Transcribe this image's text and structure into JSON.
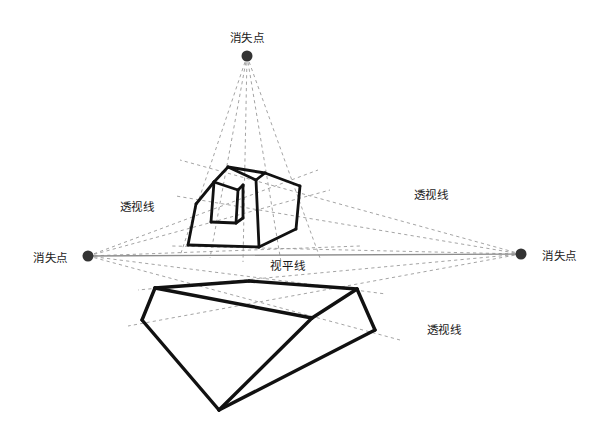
{
  "diagram": {
    "background_color": "#ffffff",
    "ink_color": "#111111",
    "guide_color": "#9a9a9a",
    "horizon_color": "#8c8c8c",
    "labels": {
      "vanishing_point_top": "消失点",
      "vanishing_point_left": "消失点",
      "vanishing_point_right": "消失点",
      "horizon_line": "视平线",
      "perspective_line_left": "透视线",
      "perspective_line_right": "透视线",
      "perspective_line_lower_right": "透视线"
    },
    "vanishing_points": [
      {
        "name": "top",
        "x": 247,
        "y": 56,
        "radius": 5.5,
        "color": "#333333"
      },
      {
        "name": "left",
        "x": 88,
        "y": 256,
        "radius": 5.5,
        "color": "#333333"
      },
      {
        "name": "right",
        "x": 521,
        "y": 254,
        "radius": 5.5,
        "color": "#333333"
      }
    ],
    "horizon": {
      "x1": 88,
      "y1": 256,
      "x2": 521,
      "y2": 254
    },
    "label_positions": {
      "vanishing_point_top": {
        "x": 247,
        "y": 42,
        "anchor": "middle"
      },
      "vanishing_point_left": {
        "x": 68,
        "y": 262,
        "anchor": "end"
      },
      "vanishing_point_right": {
        "x": 542,
        "y": 260,
        "anchor": "start"
      },
      "horizon_line": {
        "x": 288,
        "y": 270,
        "anchor": "middle"
      },
      "perspective_line_left": {
        "x": 137,
        "y": 211,
        "anchor": "middle"
      },
      "perspective_line_right": {
        "x": 431,
        "y": 199,
        "anchor": "middle"
      },
      "perspective_line_lower_right": {
        "x": 444,
        "y": 334,
        "anchor": "middle"
      }
    },
    "upper_box": {
      "name": "upper-cube",
      "outline": [
        [
          188,
          245
        ],
        [
          196,
          204
        ],
        [
          214,
          182
        ],
        [
          228,
          167
        ],
        [
          265,
          173
        ],
        [
          300,
          186
        ],
        [
          296,
          229
        ],
        [
          259,
          247
        ]
      ],
      "edges": [
        {
          "from": [
            188,
            245
          ],
          "to": [
            259,
            247
          ]
        },
        {
          "from": [
            259,
            247
          ],
          "to": [
            296,
            229
          ]
        },
        {
          "from": [
            296,
            229
          ],
          "to": [
            300,
            186
          ]
        },
        {
          "from": [
            300,
            186
          ],
          "to": [
            265,
            173
          ]
        },
        {
          "from": [
            265,
            173
          ],
          "to": [
            228,
            167
          ]
        },
        {
          "from": [
            228,
            167
          ],
          "to": [
            214,
            182
          ]
        },
        {
          "from": [
            214,
            182
          ],
          "to": [
            196,
            204
          ]
        },
        {
          "from": [
            196,
            204
          ],
          "to": [
            188,
            245
          ]
        },
        {
          "from": [
            259,
            247
          ],
          "to": [
            256,
            180
          ]
        },
        {
          "from": [
            256,
            180
          ],
          "to": [
            228,
            167
          ]
        },
        {
          "from": [
            256,
            180
          ],
          "to": [
            265,
            173
          ]
        },
        {
          "from": [
            214,
            182
          ],
          "to": [
            238,
            190
          ]
        },
        {
          "from": [
            238,
            190
          ],
          "to": [
            236,
            223
          ]
        },
        {
          "from": [
            236,
            223
          ],
          "to": [
            211,
            222
          ]
        },
        {
          "from": [
            211,
            222
          ],
          "to": [
            214,
            182
          ]
        },
        {
          "from": [
            238,
            190
          ],
          "to": [
            243,
            185
          ]
        },
        {
          "from": [
            243,
            185
          ],
          "to": [
            243,
            218
          ]
        },
        {
          "from": [
            243,
            218
          ],
          "to": [
            236,
            223
          ]
        }
      ]
    },
    "lower_box": {
      "name": "lower-cube",
      "edges": [
        {
          "from": [
            155,
            288
          ],
          "to": [
            249,
            281
          ]
        },
        {
          "from": [
            249,
            281
          ],
          "to": [
            357,
            289
          ]
        },
        {
          "from": [
            357,
            289
          ],
          "to": [
            312,
            318
          ]
        },
        {
          "from": [
            312,
            318
          ],
          "to": [
            155,
            288
          ]
        },
        {
          "from": [
            155,
            288
          ],
          "to": [
            142,
            320
          ]
        },
        {
          "from": [
            142,
            320
          ],
          "to": [
            219,
            410
          ]
        },
        {
          "from": [
            219,
            410
          ],
          "to": [
            312,
            318
          ]
        },
        {
          "from": [
            219,
            410
          ],
          "to": [
            375,
            330
          ]
        },
        {
          "from": [
            375,
            330
          ],
          "to": [
            357,
            289
          ]
        }
      ]
    },
    "guides_from_top_vp": [
      [
        [
          247,
          56
        ],
        [
          180,
          256
        ]
      ],
      [
        [
          247,
          56
        ],
        [
          210,
          258
        ]
      ],
      [
        [
          247,
          56
        ],
        [
          243,
          262
        ]
      ],
      [
        [
          247,
          56
        ],
        [
          281,
          262
        ]
      ],
      [
        [
          247,
          56
        ],
        [
          320,
          258
        ]
      ]
    ],
    "guides_from_left_vp": [
      [
        [
          88,
          256
        ],
        [
          318,
          170
        ]
      ],
      [
        [
          88,
          256
        ],
        [
          330,
          190
        ]
      ],
      [
        [
          88,
          256
        ],
        [
          360,
          246
        ]
      ],
      [
        [
          88,
          256
        ],
        [
          386,
          294
        ]
      ],
      [
        [
          88,
          256
        ],
        [
          400,
          340
        ]
      ]
    ],
    "guides_from_right_vp": [
      [
        [
          521,
          254
        ],
        [
          180,
          160
        ]
      ],
      [
        [
          521,
          254
        ],
        [
          176,
          196
        ]
      ],
      [
        [
          521,
          254
        ],
        [
          172,
          246
        ]
      ],
      [
        [
          521,
          254
        ],
        [
          138,
          290
        ]
      ],
      [
        [
          521,
          254
        ],
        [
          128,
          326
        ]
      ]
    ]
  }
}
